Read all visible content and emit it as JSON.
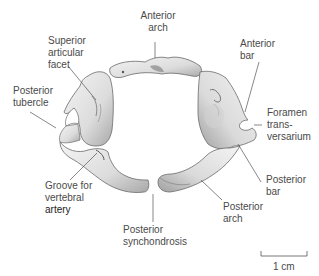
{
  "diagram": {
    "labels": {
      "anterior_arch": [
        "Anterior",
        "arch"
      ],
      "superior_articular_facet": [
        "Superior",
        "articular",
        "facet"
      ],
      "anterior_bar": [
        "Anterior",
        "bar"
      ],
      "posterior_tubercle": [
        "Posterior",
        "tubercle"
      ],
      "foramen_transversarium": [
        "Foramen",
        "trans-",
        "versarium"
      ],
      "posterior_bar": [
        "Posterior",
        "bar"
      ],
      "groove_vertebral_artery": [
        "Groove for",
        "vertebral",
        "artery"
      ],
      "posterior_arch": [
        "Posterior",
        "arch"
      ],
      "posterior_synchondrosis": [
        "Posterior",
        "synchondrosis"
      ]
    },
    "scale_bar": {
      "label": "1 cm"
    },
    "colors": {
      "text": "#4a4a4a",
      "leader": "#555555",
      "bone_fill": "#e9e9e9",
      "bone_shade": "#9a9a9a",
      "bone_outline": "#6a6a6a"
    }
  }
}
